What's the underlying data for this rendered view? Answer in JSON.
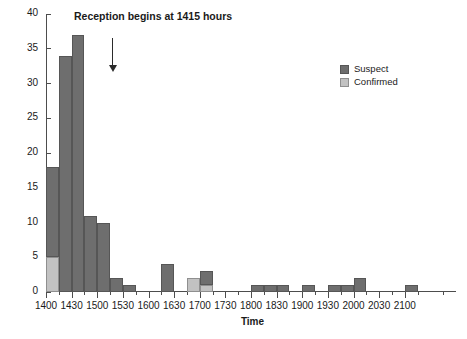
{
  "chart_data": {
    "type": "bar",
    "title": "",
    "xlabel": "Time",
    "ylabel": "Number of Cases",
    "ylim": [
      0,
      40
    ],
    "ytick_step": 5,
    "yticks": [
      0,
      5,
      10,
      15,
      20,
      25,
      30,
      35,
      40
    ],
    "grid": false,
    "stacked": true,
    "bin_minutes": 15,
    "xlim": [
      "1400",
      "2130"
    ],
    "xtick_labels": [
      "1400",
      "1430",
      "1500",
      "1530",
      "1600",
      "1630",
      "1700",
      "1730",
      "1800",
      "1830",
      "1900",
      "1930",
      "2000",
      "2030",
      "2100"
    ],
    "xtick_step_minutes": 30,
    "legend": {
      "position": "top-right",
      "entries": [
        {
          "name": "Suspect",
          "color": "#6e6e6e"
        },
        {
          "name": "Confirmed",
          "color": "#c2c2c2"
        }
      ]
    },
    "series": [
      {
        "name": "Suspect",
        "color": "#6e6e6e",
        "values": [
          13,
          34,
          37,
          11,
          10,
          2,
          1,
          0,
          0,
          4,
          0,
          0,
          2,
          0,
          0,
          2,
          0,
          0,
          0,
          1,
          1,
          1,
          0,
          1,
          0,
          1,
          1,
          2,
          0,
          0,
          0,
          1
        ]
      },
      {
        "name": "Confirmed",
        "color": "#c2c2c2",
        "values": [
          5,
          0,
          0,
          0,
          0,
          0,
          0,
          0,
          0,
          0,
          0,
          2,
          0,
          1,
          0,
          0,
          0,
          0,
          0,
          0,
          0,
          0,
          0,
          0,
          0,
          0,
          0,
          0,
          0,
          0,
          0,
          0
        ]
      }
    ],
    "bins": [
      {
        "start": "1400",
        "suspect": 13,
        "confirmed": 5
      },
      {
        "start": "1415",
        "suspect": 34,
        "confirmed": 0
      },
      {
        "start": "1430",
        "suspect": 37,
        "confirmed": 0
      },
      {
        "start": "1445",
        "suspect": 11,
        "confirmed": 0
      },
      {
        "start": "1500",
        "suspect": 10,
        "confirmed": 0
      },
      {
        "start": "1515",
        "suspect": 2,
        "confirmed": 0
      },
      {
        "start": "1530",
        "suspect": 1,
        "confirmed": 0
      },
      {
        "start": "1545",
        "suspect": 0,
        "confirmed": 0
      },
      {
        "start": "1600",
        "suspect": 0,
        "confirmed": 0
      },
      {
        "start": "1615",
        "suspect": 4,
        "confirmed": 0
      },
      {
        "start": "1630",
        "suspect": 0,
        "confirmed": 0
      },
      {
        "start": "1645",
        "suspect": 0,
        "confirmed": 2
      },
      {
        "start": "1700",
        "suspect": 2,
        "confirmed": 1
      },
      {
        "start": "1715",
        "suspect": 0,
        "confirmed": 0
      },
      {
        "start": "1730",
        "suspect": 0,
        "confirmed": 0
      },
      {
        "start": "1745",
        "suspect": 0,
        "confirmed": 0
      },
      {
        "start": "1800",
        "suspect": 1,
        "confirmed": 0
      },
      {
        "start": "1815",
        "suspect": 1,
        "confirmed": 0
      },
      {
        "start": "1830",
        "suspect": 1,
        "confirmed": 0
      },
      {
        "start": "1845",
        "suspect": 0,
        "confirmed": 0
      },
      {
        "start": "1900",
        "suspect": 1,
        "confirmed": 0
      },
      {
        "start": "1915",
        "suspect": 0,
        "confirmed": 0
      },
      {
        "start": "1930",
        "suspect": 1,
        "confirmed": 0
      },
      {
        "start": "1945",
        "suspect": 1,
        "confirmed": 0
      },
      {
        "start": "2000",
        "suspect": 2,
        "confirmed": 0
      },
      {
        "start": "2015",
        "suspect": 0,
        "confirmed": 0
      },
      {
        "start": "2030",
        "suspect": 0,
        "confirmed": 0
      },
      {
        "start": "2045",
        "suspect": 0,
        "confirmed": 0
      },
      {
        "start": "2100",
        "suspect": 1,
        "confirmed": 0
      }
    ],
    "annotations": [
      {
        "text": "Reception begins at 1415 hours",
        "at": "1415",
        "style": "down-arrow"
      }
    ]
  }
}
